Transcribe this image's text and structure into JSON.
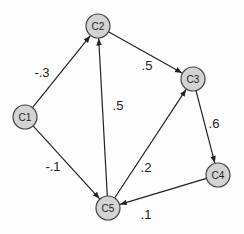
{
  "diagram": {
    "type": "directed-graph",
    "colors": {
      "node_fill": "#d3d3d3",
      "node_stroke": "#444444",
      "edge": "#222222",
      "text": "#222222"
    },
    "node_radius": 12,
    "nodes": [
      {
        "id": "C1",
        "label": "C1",
        "x": 25,
        "y": 117
      },
      {
        "id": "C2",
        "label": "C2",
        "x": 98,
        "y": 26
      },
      {
        "id": "C3",
        "label": "C3",
        "x": 193,
        "y": 79
      },
      {
        "id": "C4",
        "label": "C4",
        "x": 218,
        "y": 175
      },
      {
        "id": "C5",
        "label": "C5",
        "x": 108,
        "y": 208
      }
    ],
    "edges": [
      {
        "from": "C1",
        "to": "C2",
        "label": "-.3",
        "lx": 42,
        "ly": 72
      },
      {
        "from": "C1",
        "to": "C5",
        "label": "-.1",
        "lx": 53,
        "ly": 166
      },
      {
        "from": "C2",
        "to": "C3",
        "label": ".5",
        "lx": 147,
        "ly": 65
      },
      {
        "from": "C5",
        "to": "C2",
        "label": ".5",
        "lx": 118,
        "ly": 105
      },
      {
        "from": "C5",
        "to": "C3",
        "label": ".2",
        "lx": 146,
        "ly": 167
      },
      {
        "from": "C3",
        "to": "C4",
        "label": ".6",
        "lx": 214,
        "ly": 123
      },
      {
        "from": "C4",
        "to": "C5",
        "label": ".1",
        "lx": 146,
        "ly": 214
      }
    ]
  }
}
